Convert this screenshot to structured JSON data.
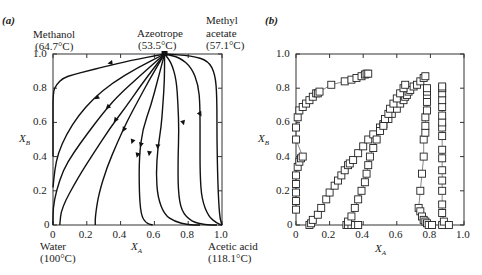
{
  "chart_data": [
    {
      "panel": "(a)",
      "type": "line",
      "title": "",
      "xlabel": "X_A",
      "ylabel": "X_B",
      "xlim": [
        0,
        1.0
      ],
      "ylim": [
        0,
        1.0
      ],
      "xticks": [
        "0",
        "0.2",
        "0.4",
        "0.6",
        "0.8",
        "1.0"
      ],
      "yticks": [
        "0",
        "0.2",
        "0.4",
        "0.6",
        "0.8",
        "1.0"
      ],
      "grid": false,
      "annotations": {
        "top_left": {
          "name": "Methanol",
          "temp": "(64.7°C)"
        },
        "top_middle": {
          "name": "Azeotrope",
          "temp": "(53.5°C)"
        },
        "top_right": {
          "name": "Methyl",
          "name2": "acetate",
          "temp": "(57.1°C)"
        },
        "bottom_left": {
          "name": "Water",
          "temp": "(100°C)"
        },
        "bottom_right": {
          "name": "Acetic acid",
          "temp": "(118.1°C)"
        }
      },
      "azeotrope_point": [
        0.66,
        1.0
      ],
      "series": [
        {
          "name": "curve1",
          "points": [
            [
              0.66,
              1.0
            ],
            [
              0.45,
              0.96
            ],
            [
              0.3,
              0.925
            ],
            [
              0.2,
              0.9
            ],
            [
              0.12,
              0.88
            ],
            [
              0.06,
              0.86
            ],
            [
              0.02,
              0.82
            ],
            [
              0.0,
              0.78
            ],
            [
              0.0,
              0.6
            ],
            [
              0.0,
              0.4
            ]
          ]
        },
        {
          "name": "curve2",
          "points": [
            [
              0.66,
              1.0
            ],
            [
              0.5,
              0.92
            ],
            [
              0.35,
              0.83
            ],
            [
              0.24,
              0.74
            ],
            [
              0.15,
              0.64
            ],
            [
              0.08,
              0.53
            ],
            [
              0.03,
              0.42
            ],
            [
              0.01,
              0.32
            ],
            [
              0.0,
              0.22
            ]
          ]
        },
        {
          "name": "curve3",
          "points": [
            [
              0.66,
              1.0
            ],
            [
              0.5,
              0.86
            ],
            [
              0.38,
              0.75
            ],
            [
              0.3,
              0.66
            ],
            [
              0.2,
              0.53
            ],
            [
              0.12,
              0.42
            ],
            [
              0.06,
              0.32
            ],
            [
              0.02,
              0.2
            ],
            [
              0.0,
              0.1
            ],
            [
              0.0,
              0.0
            ]
          ]
        },
        {
          "name": "curve4",
          "points": [
            [
              0.66,
              1.0
            ],
            [
              0.53,
              0.83
            ],
            [
              0.43,
              0.69
            ],
            [
              0.34,
              0.57
            ],
            [
              0.24,
              0.42
            ],
            [
              0.15,
              0.28
            ],
            [
              0.05,
              0.1
            ],
            [
              0.04,
              0.0
            ]
          ]
        },
        {
          "name": "curve5",
          "points": [
            [
              0.66,
              1.0
            ],
            [
              0.57,
              0.85
            ],
            [
              0.5,
              0.72
            ],
            [
              0.44,
              0.61
            ],
            [
              0.38,
              0.48
            ],
            [
              0.32,
              0.34
            ],
            [
              0.27,
              0.18
            ],
            [
              0.25,
              0.05
            ],
            [
              0.25,
              0.0
            ]
          ]
        },
        {
          "name": "curve6",
          "points": [
            [
              0.66,
              1.0
            ],
            [
              0.62,
              0.85
            ],
            [
              0.58,
              0.7
            ],
            [
              0.53,
              0.56
            ],
            [
              0.51,
              0.4
            ],
            [
              0.51,
              0.2
            ],
            [
              0.52,
              0.06
            ],
            [
              0.55,
              0.01
            ],
            [
              0.59,
              0.0
            ]
          ]
        },
        {
          "name": "curve7",
          "points": [
            [
              0.66,
              1.0
            ],
            [
              0.66,
              0.85
            ],
            [
              0.65,
              0.7
            ],
            [
              0.64,
              0.57
            ],
            [
              0.62,
              0.45
            ],
            [
              0.61,
              0.3
            ],
            [
              0.62,
              0.16
            ],
            [
              0.66,
              0.06
            ],
            [
              0.72,
              0.02
            ],
            [
              0.8,
              0.0
            ],
            [
              0.87,
              0.0
            ]
          ]
        },
        {
          "name": "curve8",
          "points": [
            [
              0.66,
              1.0
            ],
            [
              0.7,
              0.95
            ],
            [
              0.73,
              0.85
            ],
            [
              0.74,
              0.7
            ],
            [
              0.745,
              0.55
            ],
            [
              0.74,
              0.4
            ],
            [
              0.74,
              0.2
            ],
            [
              0.76,
              0.08
            ],
            [
              0.82,
              0.02
            ],
            [
              0.9,
              0.0
            ],
            [
              0.97,
              0.0
            ]
          ]
        },
        {
          "name": "curve9",
          "points": [
            [
              0.66,
              1.0
            ],
            [
              0.75,
              0.98
            ],
            [
              0.82,
              0.92
            ],
            [
              0.86,
              0.82
            ],
            [
              0.87,
              0.7
            ],
            [
              0.87,
              0.5
            ],
            [
              0.87,
              0.3
            ],
            [
              0.88,
              0.15
            ],
            [
              0.92,
              0.05
            ],
            [
              0.97,
              0.01
            ],
            [
              1.0,
              0.0
            ]
          ]
        },
        {
          "name": "curve10",
          "points": [
            [
              0.66,
              1.0
            ],
            [
              0.82,
              0.99
            ],
            [
              0.92,
              0.96
            ],
            [
              0.96,
              0.88
            ],
            [
              0.97,
              0.75
            ],
            [
              0.97,
              0.5
            ],
            [
              0.975,
              0.25
            ],
            [
              0.985,
              0.05
            ],
            [
              1.0,
              0.0
            ]
          ]
        }
      ],
      "arrows": [
        [
          0.34,
          0.948
        ],
        [
          0.26,
          0.745
        ],
        [
          0.325,
          0.69
        ],
        [
          0.37,
          0.615
        ],
        [
          0.42,
          0.56
        ],
        [
          0.47,
          0.49
        ],
        [
          0.52,
          0.47
        ],
        [
          0.62,
          0.46
        ],
        [
          0.77,
          0.6
        ],
        [
          0.87,
          0.65
        ],
        [
          0.57,
          0.42
        ],
        [
          0.5,
          0.41
        ]
      ]
    },
    {
      "panel": "(b)",
      "type": "scatter",
      "title": "",
      "xlabel": "X_A",
      "ylabel": "X_B",
      "xlim": [
        0,
        1.0
      ],
      "ylim": [
        0,
        1.0
      ],
      "xticks": [
        "0",
        "0.2",
        "0.4",
        "0.6",
        "0.8",
        "1.0"
      ],
      "yticks": [
        "0",
        "0.2",
        "0.4",
        "0.6",
        "0.8",
        "1.0"
      ],
      "grid": false,
      "marker": "open-square",
      "series": [
        {
          "name": "series1",
          "points": [
            [
              0.0,
              0.09
            ],
            [
              0.0,
              0.14
            ],
            [
              0.0,
              0.19
            ],
            [
              0.0,
              0.24
            ],
            [
              0.0,
              0.29
            ],
            [
              0.01,
              0.34
            ],
            [
              0.02,
              0.37
            ],
            [
              0.03,
              0.39
            ],
            [
              0.04,
              0.4
            ],
            [
              0.0,
              0.5
            ],
            [
              0.0,
              0.57
            ],
            [
              0.01,
              0.63
            ],
            [
              0.02,
              0.67
            ],
            [
              0.04,
              0.69
            ],
            [
              0.06,
              0.71
            ],
            [
              0.08,
              0.73
            ],
            [
              0.1,
              0.75
            ],
            [
              0.12,
              0.77
            ],
            [
              0.13,
              0.77
            ],
            [
              0.14,
              0.78
            ],
            [
              0.21,
              0.82
            ],
            [
              0.29,
              0.84
            ],
            [
              0.33,
              0.85
            ],
            [
              0.36,
              0.86
            ],
            [
              0.39,
              0.87
            ],
            [
              0.41,
              0.88
            ],
            [
              0.42,
              0.885
            ],
            [
              0.43,
              0.885
            ]
          ]
        },
        {
          "name": "series2",
          "points": [
            [
              0.08,
              0.0
            ],
            [
              0.09,
              0.01
            ],
            [
              0.1,
              0.03
            ],
            [
              0.13,
              0.06
            ],
            [
              0.15,
              0.1
            ],
            [
              0.18,
              0.15
            ],
            [
              0.2,
              0.19
            ],
            [
              0.23,
              0.23
            ],
            [
              0.25,
              0.26
            ],
            [
              0.27,
              0.29
            ],
            [
              0.29,
              0.32
            ],
            [
              0.31,
              0.35
            ],
            [
              0.32,
              0.36
            ],
            [
              0.34,
              0.38
            ],
            [
              0.37,
              0.42
            ],
            [
              0.4,
              0.46
            ],
            [
              0.43,
              0.5
            ],
            [
              0.46,
              0.53
            ],
            [
              0.5,
              0.57
            ],
            [
              0.52,
              0.59
            ],
            [
              0.55,
              0.62
            ],
            [
              0.57,
              0.65
            ],
            [
              0.6,
              0.68
            ],
            [
              0.62,
              0.71
            ],
            [
              0.64,
              0.73
            ],
            [
              0.65,
              0.75
            ],
            [
              0.66,
              0.76
            ],
            [
              0.67,
              0.78
            ],
            [
              0.68,
              0.79
            ],
            [
              0.7,
              0.81
            ],
            [
              0.72,
              0.82
            ],
            [
              0.74,
              0.84
            ],
            [
              0.76,
              0.86
            ],
            [
              0.77,
              0.87
            ]
          ]
        },
        {
          "name": "series3",
          "points": [
            [
              0.3,
              0.0
            ],
            [
              0.31,
              0.0
            ],
            [
              0.33,
              0.0
            ],
            [
              0.35,
              0.0
            ],
            [
              0.37,
              0.0
            ],
            [
              0.31,
              0.02
            ],
            [
              0.33,
              0.05
            ],
            [
              0.35,
              0.1
            ],
            [
              0.37,
              0.15
            ],
            [
              0.39,
              0.2
            ],
            [
              0.41,
              0.25
            ],
            [
              0.42,
              0.3
            ],
            [
              0.43,
              0.35
            ],
            [
              0.44,
              0.4
            ],
            [
              0.46,
              0.45
            ],
            [
              0.48,
              0.5
            ],
            [
              0.5,
              0.55
            ],
            [
              0.52,
              0.58
            ],
            [
              0.53,
              0.62
            ],
            [
              0.55,
              0.65
            ],
            [
              0.56,
              0.68
            ],
            [
              0.58,
              0.71
            ],
            [
              0.6,
              0.74
            ],
            [
              0.62,
              0.77
            ],
            [
              0.64,
              0.8
            ],
            [
              0.65,
              0.82
            ]
          ]
        },
        {
          "name": "series4",
          "points": [
            [
              0.73,
              0.1
            ],
            [
              0.74,
              0.08
            ],
            [
              0.75,
              0.05
            ],
            [
              0.76,
              0.03
            ],
            [
              0.77,
              0.02
            ],
            [
              0.78,
              0.01
            ],
            [
              0.79,
              0.0
            ],
            [
              0.81,
              0.0
            ],
            [
              0.74,
              0.2
            ],
            [
              0.75,
              0.3
            ],
            [
              0.76,
              0.4
            ],
            [
              0.76,
              0.5
            ],
            [
              0.77,
              0.54
            ],
            [
              0.77,
              0.58
            ],
            [
              0.77,
              0.63
            ],
            [
              0.78,
              0.67
            ],
            [
              0.78,
              0.72
            ],
            [
              0.78,
              0.76
            ],
            [
              0.78,
              0.78
            ],
            [
              0.78,
              0.8
            ]
          ]
        },
        {
          "name": "series5",
          "points": [
            [
              0.87,
              0.0
            ],
            [
              0.88,
              0.02
            ],
            [
              0.91,
              0.0
            ],
            [
              0.87,
              0.07
            ],
            [
              0.87,
              0.12
            ],
            [
              0.87,
              0.2
            ],
            [
              0.87,
              0.26
            ],
            [
              0.87,
              0.32
            ],
            [
              0.87,
              0.39
            ],
            [
              0.87,
              0.44
            ],
            [
              0.87,
              0.52
            ],
            [
              0.87,
              0.57
            ],
            [
              0.87,
              0.6
            ],
            [
              0.87,
              0.64
            ],
            [
              0.87,
              0.69
            ],
            [
              0.87,
              0.73
            ],
            [
              0.87,
              0.77
            ],
            [
              0.87,
              0.8
            ],
            [
              0.87,
              0.81
            ]
          ]
        }
      ]
    }
  ],
  "labels": {
    "panel_a": "(a)",
    "panel_b": "(b)",
    "methanol": "Methanol",
    "methanol_temp": "(64.7°C)",
    "azeotrope": "Azeotrope",
    "azeotrope_temp": "(53.5°C)",
    "methyl": "Methyl",
    "acetate": "acetate",
    "methyl_acetate_temp": "(57.1°C)",
    "water": "Water",
    "water_temp": "(100°C)",
    "acetic_acid": "Acetic acid",
    "acetic_acid_temp": "(118.1°C)",
    "xlabel_main": "X",
    "xlabel_sub": "A",
    "ylabel_main": "X",
    "ylabel_sub": "B",
    "ticks": [
      "0",
      "0.2",
      "0.4",
      "0.6",
      "0.8",
      "1.0"
    ]
  }
}
